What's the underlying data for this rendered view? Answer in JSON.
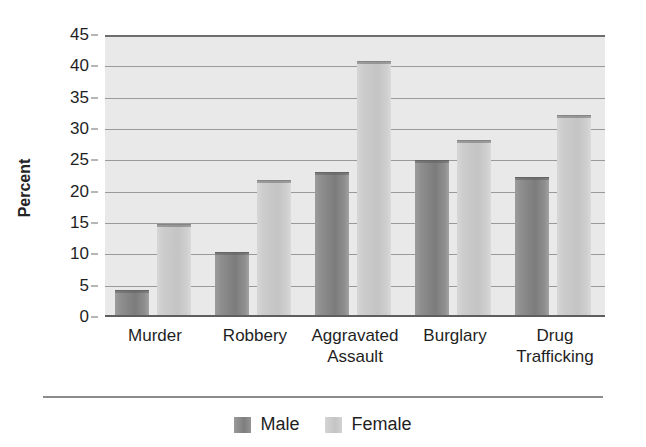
{
  "chart_data": {
    "type": "bar",
    "title": "",
    "xlabel": "",
    "ylabel": "Percent",
    "ylim": [
      0,
      45
    ],
    "ytick_step": 5,
    "yticks": [
      0,
      5,
      10,
      15,
      20,
      25,
      30,
      35,
      40,
      45
    ],
    "grid": true,
    "legend_position": "bottom-center",
    "categories": [
      "Murder",
      "Aggravated Assault",
      "Robbery",
      "Burglary",
      "Drug Trafficking"
    ],
    "category_labels": [
      {
        "line1": "Murder",
        "line2": ""
      },
      {
        "line1": "Robbery",
        "line2": ""
      },
      {
        "line1": "Aggravated",
        "line2": "Assault"
      },
      {
        "line1": "Burglary",
        "line2": ""
      },
      {
        "line1": "Drug",
        "line2": "Trafficking"
      }
    ],
    "series": [
      {
        "name": "Male",
        "color": "#8a8a8a",
        "values": [
          4.3,
          10.4,
          23.1,
          25.1,
          22.4
        ]
      },
      {
        "name": "Female",
        "color": "#c9c9c9",
        "values": [
          14.8,
          21.8,
          40.8,
          28.3,
          32.2
        ]
      }
    ]
  },
  "legend": {
    "items": [
      {
        "label": "Male",
        "swatch": "male-swatch"
      },
      {
        "label": "Female",
        "swatch": "female-swatch"
      }
    ]
  }
}
